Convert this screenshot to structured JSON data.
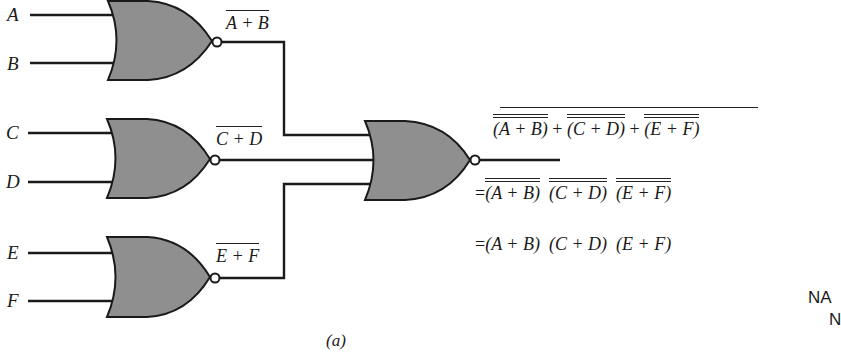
{
  "diagram": {
    "inputs": [
      "A",
      "B",
      "C",
      "D",
      "E",
      "F"
    ],
    "gates": [
      {
        "id": "nor1",
        "type": "NOR",
        "inputs": [
          "A",
          "B"
        ],
        "output_label": "A + B"
      },
      {
        "id": "nor2",
        "type": "NOR",
        "inputs": [
          "C",
          "D"
        ],
        "output_label": "C + D"
      },
      {
        "id": "nor3",
        "type": "NOR",
        "inputs": [
          "E",
          "F"
        ],
        "output_label": "E + F"
      },
      {
        "id": "nor4",
        "type": "NOR",
        "inputs": [
          "nor1",
          "nor2",
          "nor3"
        ]
      }
    ],
    "labels": {
      "A": "A",
      "B": "B",
      "C": "C",
      "D": "D",
      "E": "E",
      "F": "F",
      "out1": "A + B",
      "out2": "C + D",
      "out3": "E + F"
    },
    "equations": {
      "line1": {
        "t1": "(A + B)",
        "plus1": " + ",
        "t2": "(C + D)",
        "plus2": " + ",
        "t3": "(E + F)"
      },
      "line2": {
        "eq": "=",
        "t1": "(A + B)",
        "t2": "(C + D)",
        "t3": "(E + F)"
      },
      "line3": {
        "eq": "=",
        "t1": "(A + B)",
        "t2": "(C + D)",
        "t3": "(E + F)"
      }
    },
    "caption": "(a)",
    "side_text": {
      "line1": "NA",
      "line2": "N"
    },
    "colors": {
      "gate_fill": "#8f8f8f",
      "line": "#1a1a1a",
      "background": "#ffffff"
    }
  }
}
